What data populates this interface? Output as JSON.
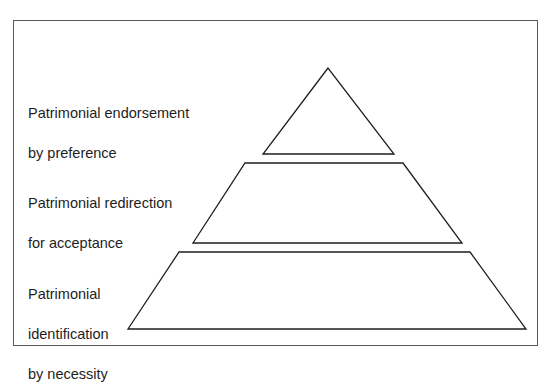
{
  "diagram": {
    "type": "pyramid",
    "frame": {
      "stroke": "#5a5a5a"
    },
    "line_color": "#1e1e1e",
    "levels": [
      {
        "id": "top",
        "shape": "triangle",
        "lines": [
          "Patrimonial endorsement",
          "by preference"
        ]
      },
      {
        "id": "middle",
        "shape": "trapezoid",
        "lines": [
          "Patrimonial redirection",
          "for acceptance"
        ]
      },
      {
        "id": "bottom",
        "shape": "trapezoid",
        "lines": [
          "Patrimonial",
          "identification",
          "by necessity"
        ]
      }
    ]
  }
}
